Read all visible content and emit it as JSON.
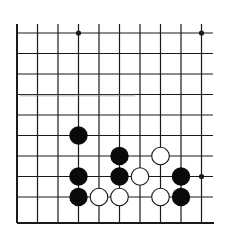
{
  "board": {
    "description": "Go board diagram fragment (lower-left corner region)",
    "columns": 10,
    "rows": 10,
    "open_edges": [
      "top",
      "right"
    ],
    "closed_edges": [
      "left",
      "bottom"
    ],
    "origin_px": {
      "x": 17,
      "y": 33
    },
    "spacing_px": 20.5,
    "line_color": "#1a1a1a",
    "star_points": [
      {
        "col": 3,
        "row": 0
      },
      {
        "col": 9,
        "row": 0
      },
      {
        "col": 9,
        "row": 7
      }
    ],
    "stones": {
      "black": [
        {
          "col": 3,
          "row": 5
        },
        {
          "col": 5,
          "row": 6
        },
        {
          "col": 3,
          "row": 7
        },
        {
          "col": 5,
          "row": 7
        },
        {
          "col": 8,
          "row": 7
        },
        {
          "col": 3,
          "row": 8
        },
        {
          "col": 8,
          "row": 8
        }
      ],
      "white": [
        {
          "col": 7,
          "row": 6
        },
        {
          "col": 6,
          "row": 7
        },
        {
          "col": 4,
          "row": 8
        },
        {
          "col": 5,
          "row": 8
        },
        {
          "col": 7,
          "row": 8
        }
      ]
    },
    "colors": {
      "black_stone": "#0a0a0a",
      "white_stone_fill": "#ffffff",
      "white_stone_outline": "#1a1a1a",
      "background": "#ffffff"
    }
  }
}
